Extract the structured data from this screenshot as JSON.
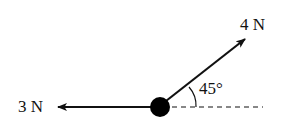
{
  "diagram": {
    "type": "force-diagram",
    "forces": [
      {
        "label": "3 N",
        "direction": "left",
        "angle_deg": 180
      },
      {
        "label": "4 N",
        "direction": "up-right",
        "angle_deg": 45
      }
    ],
    "angle_label": "45°",
    "reference_line": "dashed horizontal",
    "colors": {
      "stroke": "#111111",
      "background": "#ffffff"
    }
  }
}
